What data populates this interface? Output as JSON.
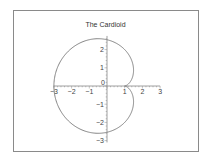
{
  "chart_data": {
    "type": "line",
    "title": "The Cardioid",
    "xlabel": "",
    "ylabel": "",
    "xlim": [
      -3,
      3
    ],
    "ylim": [
      -3,
      3
    ],
    "xticks": [
      -3,
      -2,
      -1,
      0,
      1,
      2,
      3
    ],
    "yticks": [
      -3,
      -2,
      -1,
      1,
      2
    ],
    "xtick_labels": [
      "-3",
      "-2",
      "-1",
      "0",
      "1",
      "2",
      "3"
    ],
    "ytick_labels": [
      "-3",
      "-2",
      "-1",
      "1",
      "2"
    ],
    "grid": false,
    "legend": null,
    "series": [
      {
        "name": "cardioid",
        "equation": "x = 1 + 2(1 - cos t) cos t, y = 2(1 - cos t) sin t",
        "color": "#777777",
        "x": [
          1,
          0.73,
          0,
          -1,
          -2,
          -2.73,
          -3,
          -2.73,
          -2,
          -1,
          0,
          0.73,
          1
        ],
        "y": [
          0,
          0.46,
          1.73,
          2.6,
          2.6,
          1.73,
          0,
          -1.73,
          -2.6,
          -2.6,
          -1.73,
          -0.46,
          0
        ]
      }
    ],
    "axes_through_origin": true
  }
}
